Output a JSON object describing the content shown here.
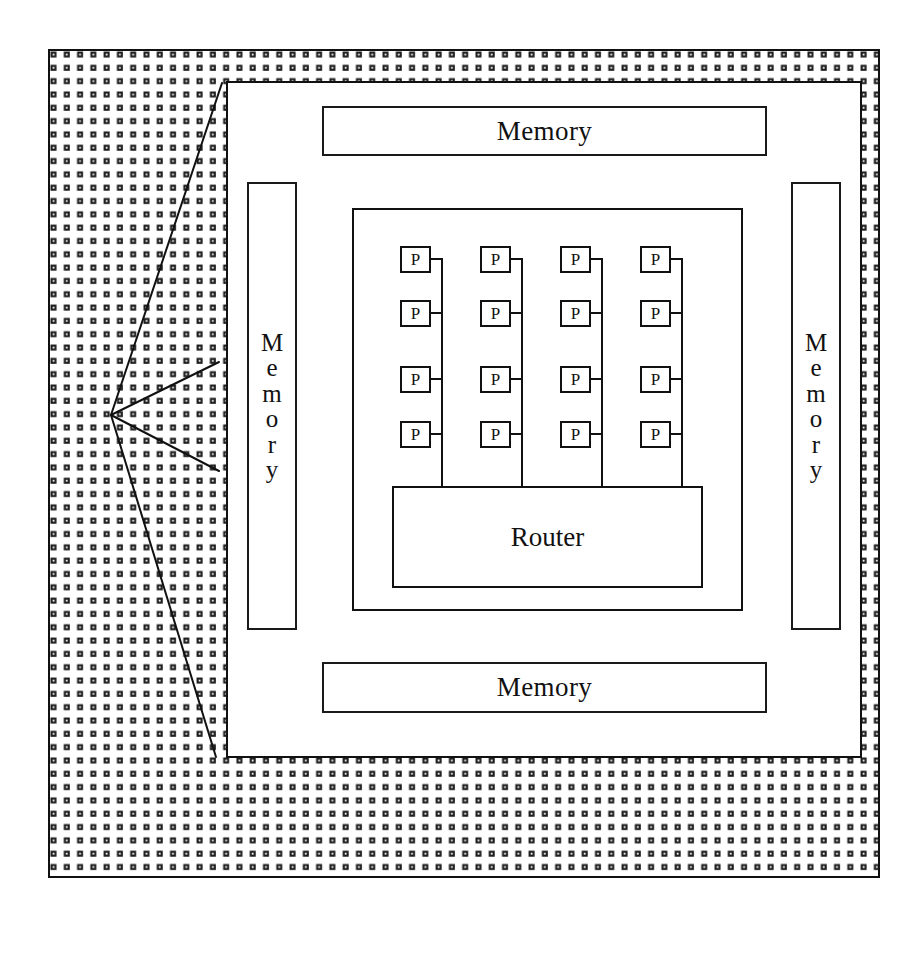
{
  "diagram": {
    "colors": {
      "line": "#111111",
      "fill": "#ffffff",
      "hatch": "#1d1d1d"
    },
    "outer_frame": {
      "name": "chip-die-boundary",
      "x": 48,
      "y": 49,
      "width": 832,
      "height": 829
    },
    "hatch_region": {
      "name": "dotted-substrate-fill",
      "dot_spacing_px": 13.3,
      "dot_size_px": 6
    },
    "inner_field": {
      "name": "inner-die-area",
      "x": 226,
      "y": 81,
      "width": 636,
      "height": 677
    },
    "memories": [
      {
        "id": "memory-top",
        "label": "Memory",
        "orientation": "horizontal",
        "x": 322,
        "y": 106,
        "width": 445,
        "height": 50
      },
      {
        "id": "memory-left",
        "label": "Memory",
        "letters": [
          "M",
          "e",
          "m",
          "o",
          "r",
          "y"
        ],
        "orientation": "vertical",
        "x": 247,
        "y": 182,
        "width": 50,
        "height": 448
      },
      {
        "id": "memory-right",
        "label": "Memory",
        "letters": [
          "M",
          "e",
          "m",
          "o",
          "r",
          "y"
        ],
        "orientation": "vertical",
        "x": 791,
        "y": 182,
        "width": 50,
        "height": 448
      },
      {
        "id": "memory-bottom",
        "label": "Memory",
        "orientation": "horizontal",
        "x": 322,
        "y": 662,
        "width": 445,
        "height": 51
      }
    ],
    "cluster": {
      "name": "processor-cluster",
      "x": 352,
      "y": 208,
      "width": 391,
      "height": 403,
      "columns": 4,
      "rows": 4,
      "processor_label": "P",
      "processor_count": 16,
      "column_x": [
        400,
        480,
        560,
        640
      ],
      "row_y": [
        246,
        300,
        366,
        421
      ],
      "bus_x": [
        443,
        523,
        603,
        683
      ],
      "p_width": 31,
      "p_height": 27,
      "router": {
        "id": "router",
        "label": "Router",
        "x": 392,
        "y": 486,
        "width": 311,
        "height": 102
      }
    },
    "callout": {
      "name": "magnification-callout",
      "vertex": {
        "x": 111,
        "y": 415
      },
      "rays": [
        {
          "id": "ray-top",
          "x2": 222,
          "y2": 83
        },
        {
          "id": "ray-upper-mid",
          "x2": 219,
          "y2": 362
        },
        {
          "id": "ray-lower-mid",
          "x2": 219,
          "y2": 471
        },
        {
          "id": "ray-bottom",
          "x2": 216,
          "y2": 757
        }
      ]
    }
  }
}
